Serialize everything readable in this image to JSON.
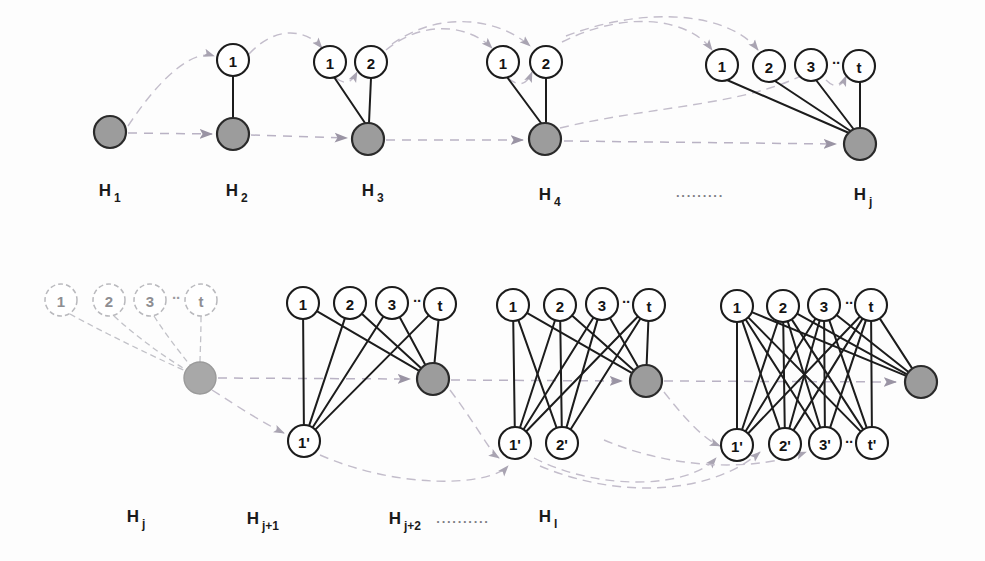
{
  "figure": {
    "background_color": "#fdfdfd",
    "ink_color": "#1c1c1c",
    "hub_fill_color": "#9c9c9c",
    "flow_color": "#b9b2c4",
    "ghost_color": "#c2c2c8"
  },
  "top_row": {
    "stages": [
      {
        "id": "H1",
        "label_main": "H",
        "label_sub": "1",
        "label_x": 105,
        "label_y": 196,
        "hub": {
          "cx": 110,
          "cy": 132,
          "r": 16
        },
        "top_nodes": []
      },
      {
        "id": "H2",
        "label_main": "H",
        "label_sub": "2",
        "label_x": 232,
        "label_y": 196,
        "hub": {
          "cx": 233,
          "cy": 134,
          "r": 16
        },
        "top_nodes": [
          {
            "text": "1",
            "cx": 233,
            "cy": 60,
            "r": 16
          }
        ]
      },
      {
        "id": "H3",
        "label_main": "H",
        "label_sub": "3",
        "label_x": 368,
        "label_y": 196,
        "hub": {
          "cx": 368,
          "cy": 139,
          "r": 16
        },
        "top_nodes": [
          {
            "text": "1",
            "cx": 330,
            "cy": 62,
            "r": 16
          },
          {
            "text": "2",
            "cx": 371,
            "cy": 62,
            "r": 16
          }
        ]
      },
      {
        "id": "H4",
        "label_main": "H",
        "label_sub": "4",
        "label_x": 545,
        "label_y": 200,
        "hub": {
          "cx": 545,
          "cy": 139,
          "r": 16
        },
        "top_nodes": [
          {
            "text": "1",
            "cx": 503,
            "cy": 62,
            "r": 16
          },
          {
            "text": "2",
            "cx": 546,
            "cy": 62,
            "r": 16
          }
        ]
      },
      {
        "id": "Hj",
        "label_main": "H",
        "label_sub": "j",
        "label_x": 860,
        "label_y": 200,
        "hub": {
          "cx": 860,
          "cy": 144,
          "r": 16
        },
        "top_nodes": [
          {
            "text": "1",
            "cx": 722,
            "cy": 65,
            "r": 16
          },
          {
            "text": "2",
            "cx": 769,
            "cy": 66,
            "r": 16
          },
          {
            "text": "3",
            "cx": 811,
            "cy": 65,
            "r": 16
          },
          {
            "text": "t",
            "cx": 859,
            "cy": 66,
            "r": 16
          }
        ],
        "inner_ellipsis": {
          "text": "··",
          "x": 836,
          "y": 62
        }
      }
    ],
    "gap_ellipsis": {
      "text": "·········",
      "x": 700,
      "y": 200
    }
  },
  "bottom_row": {
    "stages": [
      {
        "id": "Hj-repeat",
        "ghost": true,
        "label_main": "H",
        "label_sub": "j",
        "label_x": 133,
        "label_y": 522,
        "hub": {
          "cx": 200,
          "cy": 378,
          "r": 16
        },
        "top_nodes": [
          {
            "text": "1",
            "cx": 61,
            "cy": 300,
            "r": 16
          },
          {
            "text": "2",
            "cx": 109,
            "cy": 300,
            "r": 16
          },
          {
            "text": "3",
            "cx": 150,
            "cy": 300,
            "r": 16
          },
          {
            "text": "t",
            "cx": 201,
            "cy": 300,
            "r": 16
          }
        ],
        "inner_ellipsis": {
          "text": "··",
          "x": 176,
          "y": 297
        },
        "bottom_nodes": []
      },
      {
        "id": "Hj+1",
        "ghost": false,
        "label_main": "H",
        "label_sub": "j+1",
        "label_x": 253,
        "label_y": 524,
        "hub": {
          "cx": 433,
          "cy": 379,
          "r": 16
        },
        "top_nodes": [
          {
            "text": "1",
            "cx": 303,
            "cy": 303,
            "r": 16
          },
          {
            "text": "2",
            "cx": 350,
            "cy": 303,
            "r": 16
          },
          {
            "text": "3",
            "cx": 392,
            "cy": 303,
            "r": 16
          },
          {
            "text": "t",
            "cx": 440,
            "cy": 304,
            "r": 16
          }
        ],
        "inner_ellipsis": {
          "text": "··",
          "x": 417,
          "y": 300
        },
        "bottom_nodes": [
          {
            "text": "1'",
            "cx": 304,
            "cy": 441,
            "r": 16
          }
        ]
      },
      {
        "id": "Hj+2",
        "ghost": false,
        "label_main": "H",
        "label_sub": "j+2",
        "label_x": 395,
        "label_y": 524,
        "hub": {
          "cx": 646,
          "cy": 381,
          "r": 16
        },
        "top_nodes": [
          {
            "text": "1",
            "cx": 513,
            "cy": 305,
            "r": 16
          },
          {
            "text": "2",
            "cx": 560,
            "cy": 305,
            "r": 16
          },
          {
            "text": "3",
            "cx": 602,
            "cy": 304,
            "r": 16
          },
          {
            "text": "t",
            "cx": 649,
            "cy": 305,
            "r": 16
          }
        ],
        "inner_ellipsis": {
          "text": "··",
          "x": 626,
          "y": 301
        },
        "bottom_nodes": [
          {
            "text": "1'",
            "cx": 515,
            "cy": 443,
            "r": 16
          },
          {
            "text": "2'",
            "cx": 562,
            "cy": 443,
            "r": 16
          }
        ]
      },
      {
        "id": "Hl",
        "ghost": false,
        "label_main": "H",
        "label_sub": "l",
        "label_x": 545,
        "label_y": 522,
        "hub": {
          "cx": 921,
          "cy": 382,
          "r": 16
        },
        "top_nodes": [
          {
            "text": "1",
            "cx": 737,
            "cy": 306,
            "r": 16
          },
          {
            "text": "2",
            "cx": 783,
            "cy": 306,
            "r": 16
          },
          {
            "text": "3",
            "cx": 824,
            "cy": 305,
            "r": 16
          },
          {
            "text": "t",
            "cx": 871,
            "cy": 305,
            "r": 16
          }
        ],
        "inner_ellipsis": {
          "text": "··",
          "x": 849,
          "y": 302
        },
        "bottom_nodes": [
          {
            "text": "1'",
            "cx": 737,
            "cy": 445,
            "r": 16
          },
          {
            "text": "2'",
            "cx": 785,
            "cy": 444,
            "r": 16
          },
          {
            "text": "3'",
            "cx": 825,
            "cy": 443,
            "r": 16
          },
          {
            "text": "t'",
            "cx": 872,
            "cy": 443,
            "r": 16
          }
        ],
        "inner_ellipsis_bottom": {
          "text": "··",
          "x": 849,
          "y": 441
        }
      }
    ],
    "gap_ellipsis": {
      "text": "··········",
      "x": 463,
      "y": 526
    }
  }
}
